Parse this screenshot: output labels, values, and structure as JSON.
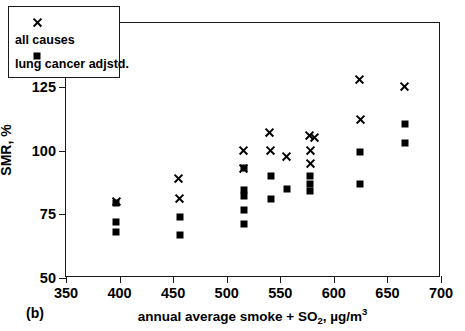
{
  "panel": {
    "label": "(b)"
  },
  "legend": {
    "entries": [
      {
        "label": "all causes",
        "marker": "cross"
      },
      {
        "label": "lung cancer adjstd.",
        "marker": "square"
      }
    ]
  },
  "chart_data": {
    "type": "scatter",
    "title": "",
    "xlabel_parts": {
      "prefix": "annual average smoke + SO",
      "sub1": "2",
      "mid": ", ",
      "unit": "µg/m",
      "sup1": "3"
    },
    "xlabel": "annual average smoke + SO2, µg/m3",
    "ylabel": "SMR, %",
    "xlim": [
      350,
      700
    ],
    "ylim": [
      50,
      150
    ],
    "xticks": [
      350,
      400,
      450,
      500,
      550,
      600,
      650,
      700
    ],
    "yticks": [
      50,
      75,
      100,
      125,
      150
    ],
    "grid": false,
    "legend_position": "top-left",
    "series": [
      {
        "name": "all causes",
        "marker": "cross",
        "color": "#000000",
        "points": [
          [
            397,
            80.0
          ],
          [
            455,
            89.0
          ],
          [
            456,
            81.0
          ],
          [
            516,
            100.0
          ],
          [
            516,
            93.0
          ],
          [
            540,
            107.0
          ],
          [
            541,
            100.0
          ],
          [
            556,
            97.5
          ],
          [
            577,
            106.0
          ],
          [
            582,
            105.0
          ],
          [
            578,
            100.0
          ],
          [
            578,
            95.0
          ],
          [
            624,
            128.0
          ],
          [
            625,
            112.0
          ],
          [
            666,
            125.0
          ]
        ]
      },
      {
        "name": "lung cancer adjstd.",
        "marker": "square",
        "color": "#000000",
        "points": [
          [
            397,
            79.5
          ],
          [
            397,
            72.0
          ],
          [
            397,
            68.0
          ],
          [
            456,
            74.0
          ],
          [
            456,
            67.0
          ],
          [
            516,
            93.0
          ],
          [
            516,
            84.5
          ],
          [
            516,
            82.0
          ],
          [
            516,
            76.5
          ],
          [
            516,
            71.0
          ],
          [
            541,
            90.0
          ],
          [
            541,
            81.0
          ],
          [
            556,
            85.0
          ],
          [
            578,
            90.0
          ],
          [
            578,
            87.0
          ],
          [
            578,
            84.0
          ],
          [
            624,
            99.5
          ],
          [
            624,
            87.0
          ],
          [
            666,
            110.5
          ],
          [
            666,
            103.0
          ]
        ]
      }
    ]
  }
}
